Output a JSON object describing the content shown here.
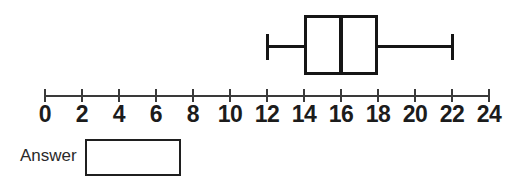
{
  "chart_data": {
    "type": "boxplot",
    "orientation": "horizontal",
    "title": "",
    "box": {
      "min": 12,
      "q1": 14,
      "median": 16,
      "q3": 18,
      "max": 22
    },
    "axis": {
      "min": 0,
      "max": 24,
      "tick_step": 2,
      "tick_labels": [
        "0",
        "2",
        "4",
        "6",
        "8",
        "10",
        "12",
        "14",
        "16",
        "18",
        "20",
        "22",
        "24"
      ],
      "grid": false
    },
    "colors": {
      "stroke": "#151515",
      "axis": "#3a3a3a",
      "background": "#ffffff"
    }
  },
  "answer": {
    "label": "Answer",
    "value": ""
  }
}
